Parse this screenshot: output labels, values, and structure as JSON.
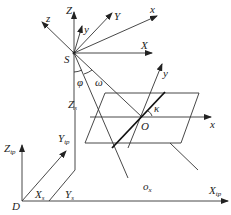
{
  "diagram": {
    "type": "coordinate-system-geometry",
    "labels": {
      "S": "S",
      "Z": "Z",
      "z": "z",
      "y_small": "y",
      "Y": "Y",
      "x_small": "x",
      "X": "X",
      "phi": "φ",
      "omega": "ω",
      "Zs": "Z",
      "Zs_sub": "s",
      "kappa": "κ",
      "O": "O",
      "x_plane": "x",
      "y_plane": "y",
      "Ztp": "Z",
      "Ztp_sub": "tp",
      "Ytp": "Y",
      "Ytp_sub": "tp",
      "Xs": "X",
      "Xs_sub": "s",
      "Ys": "Y",
      "Ys_sub": "s",
      "ox": "o",
      "ox_sub": "x",
      "D": "D",
      "Xtp": "X",
      "Xtp_sub": "tp"
    }
  }
}
